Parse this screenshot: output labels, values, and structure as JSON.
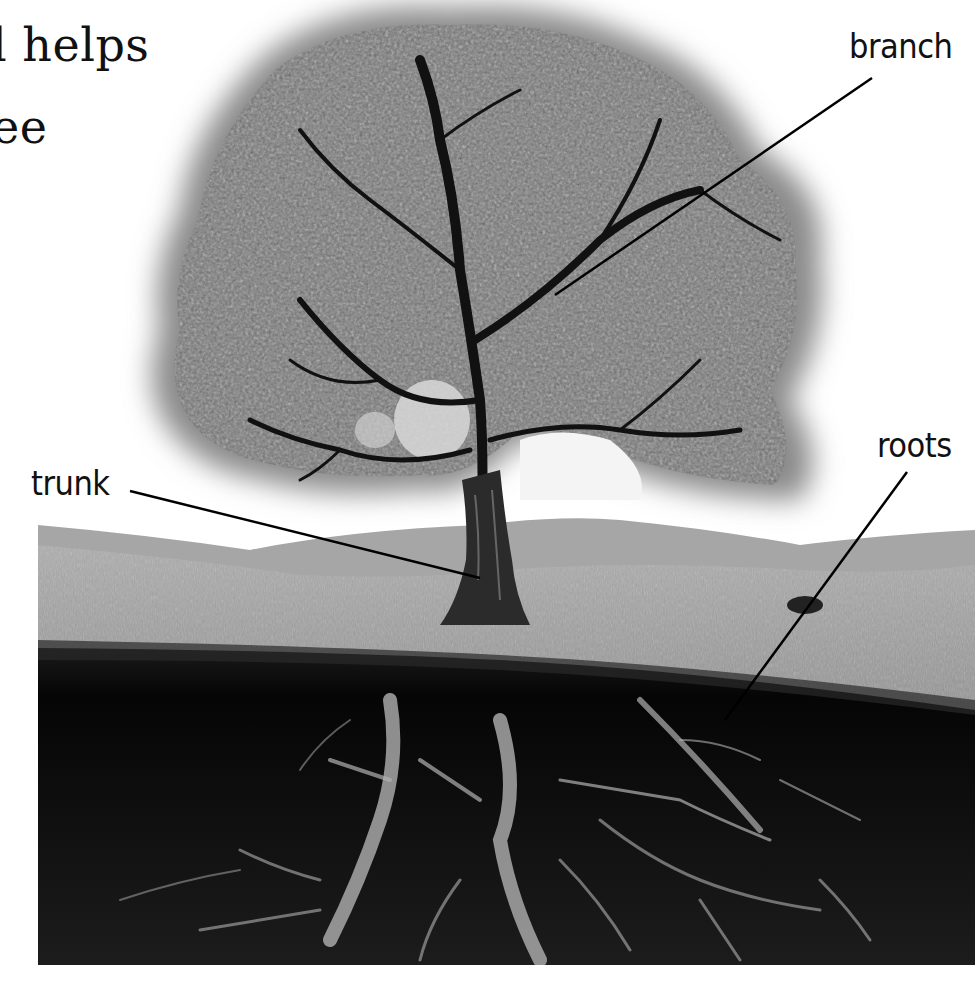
{
  "figure": {
    "caption_fragment": {
      "line1": "l helps",
      "line2": "ee"
    },
    "labels": {
      "branch": "branch",
      "trunk": "trunk",
      "roots": "roots"
    },
    "colors": {
      "background": "#ffffff",
      "sky_glow": "#9a9a9a",
      "canopy": "#7c7c7c",
      "grass": "#9c9c9c",
      "hill": "#a8a8a8",
      "soil": "#0d0d0d",
      "roots": "#b5b5b5",
      "text": "#111111"
    }
  }
}
